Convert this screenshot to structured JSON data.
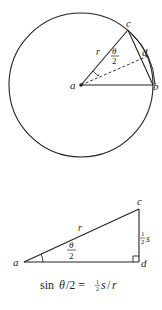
{
  "figure_top": {
    "description": "Circle with center a, radius r, chord cb and arc s, angle theta/2 bisected",
    "points": {
      "a": {
        "label": "a"
      },
      "b": {
        "label": "b"
      },
      "c": {
        "label": "c"
      },
      "d": {
        "label": "d"
      }
    },
    "radius_label": "r",
    "angle_label_num": "θ",
    "angle_label_den": "2"
  },
  "figure_bottom": {
    "description": "Right triangle a-d-c with hypotenuse r, opposite side half s, angle theta/2",
    "points": {
      "a": {
        "label": "a"
      },
      "c": {
        "label": "c"
      },
      "d": {
        "label": "d"
      }
    },
    "hypotenuse_label": "r",
    "side_label_frac_num": "1",
    "side_label_frac_den": "2",
    "side_label_var": "s",
    "angle_label_num": "θ",
    "angle_label_den": "2"
  },
  "equation": {
    "prefix": "sin ",
    "theta": "θ",
    "middle": "/2 = ",
    "frac_num": "1",
    "frac_den": "2",
    "suffix_var": "s",
    "slash": "/",
    "r": "r"
  },
  "colors": {
    "stroke": "#222222",
    "background": "#ffffff"
  }
}
